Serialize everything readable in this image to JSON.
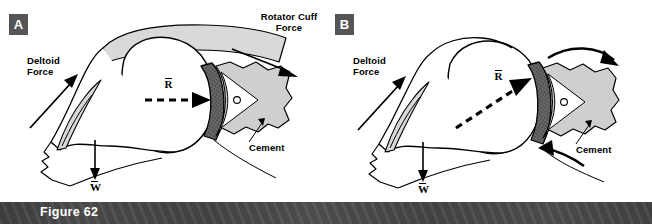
{
  "figure": {
    "caption": "Figure 62",
    "caption_bar_color": "#474747",
    "background_color": "#ffffff"
  },
  "panels": [
    {
      "id": "A",
      "badge_label": "A",
      "badge_color": "#555555",
      "labels": {
        "rotator_cuff_force": "Rotator  Cuff\nForce",
        "deltoid_force": "Deltoid\nForce",
        "cement": "Cement",
        "resultant_symbol": "R",
        "weight_symbol": "W"
      }
    },
    {
      "id": "B",
      "badge_label": "B",
      "badge_color": "#555555",
      "labels": {
        "deltoid_force": "Deltoid\nForce",
        "cement": "Cement",
        "resultant_symbol": "R",
        "weight_symbol": "W"
      }
    }
  ],
  "colors": {
    "muscle_fill": "#d9d9d9",
    "bone_fill": "#ffffff",
    "scapula_fill": "#cfcfcf",
    "component_fill": "#6e6e6e",
    "outline": "#000000",
    "badge_bg": "#555555",
    "badge_text": "#ffffff",
    "caption_text": "#ffffff"
  }
}
